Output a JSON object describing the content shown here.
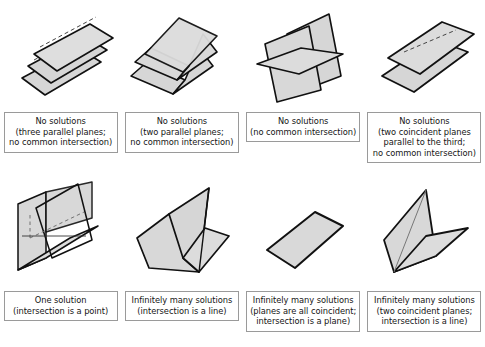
{
  "figure": {
    "colors": {
      "plane_fill": "#d6d6d6",
      "plane_fill_light": "#dedede",
      "plane_edge": "#111111",
      "hidden_edge": "#555555",
      "caption_border": "#9a9a9a",
      "text": "#151515",
      "background": "#ffffff"
    },
    "rows": 2,
    "columns": 4
  },
  "cases": [
    {
      "id": "three-parallel-planes",
      "diagram_name": "three-parallel-planes-diagram",
      "solutions": "No solutions",
      "caption_lines": [
        "No solutions",
        "(three parallel planes;",
        "no common intersection)"
      ]
    },
    {
      "id": "two-parallel-planes",
      "diagram_name": "two-parallel-planes-diagram",
      "solutions": "No solutions",
      "caption_lines": [
        "No solutions",
        "(two parallel planes;",
        "no common intersection)"
      ]
    },
    {
      "id": "no-common-intersection-prism",
      "diagram_name": "triangular-prism-planes-diagram",
      "solutions": "No solutions",
      "caption_lines": [
        "No solutions",
        "(no common intersection)"
      ]
    },
    {
      "id": "two-coincident-parallel-to-third",
      "diagram_name": "two-coincident-planes-parallel-diagram",
      "solutions": "No solutions",
      "caption_lines": [
        "No solutions",
        "(two coincident planes",
        "parallel to the third;",
        "no common intersection)"
      ]
    },
    {
      "id": "one-solution-point",
      "diagram_name": "three-planes-meeting-at-point-diagram",
      "solutions": "One solution",
      "caption_lines": [
        "One solution",
        "(intersection is a point)"
      ]
    },
    {
      "id": "infinite-line",
      "diagram_name": "three-planes-common-line-diagram",
      "solutions": "Infinitely many solutions",
      "caption_lines": [
        "Infinitely many solutions",
        "(intersection is a line)"
      ]
    },
    {
      "id": "all-coincident",
      "diagram_name": "coincident-planes-diagram",
      "solutions": "Infinitely many solutions",
      "caption_lines": [
        "Infinitely many solutions",
        "(planes are all coincident;",
        "intersection is a plane)"
      ]
    },
    {
      "id": "two-coincident-line",
      "diagram_name": "two-coincident-planes-line-diagram",
      "solutions": "Infinitely many solutions",
      "caption_lines": [
        "Infinitely many solutions",
        "(two coincident planes;",
        "intersection is a line)"
      ]
    }
  ]
}
